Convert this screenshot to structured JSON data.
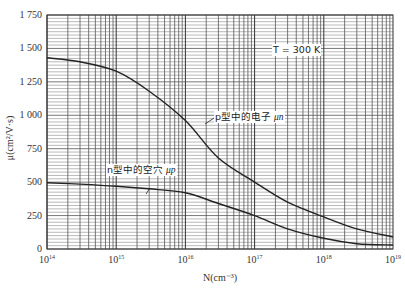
{
  "chart_data": {
    "type": "line",
    "title": "",
    "xlabel": "N(cm⁻³)",
    "ylabel": "μ(cm²/V·s)",
    "xscale": "log",
    "xlim": [
      100000000000000.0,
      1e+19
    ],
    "ylim": [
      0,
      1750
    ],
    "grid": true,
    "x_tick_labels": [
      {
        "base": "10",
        "exp": "14"
      },
      {
        "base": "10",
        "exp": "15"
      },
      {
        "base": "10",
        "exp": "16"
      },
      {
        "base": "10",
        "exp": "17"
      },
      {
        "base": "10",
        "exp": "18"
      },
      {
        "base": "10",
        "exp": "19"
      }
    ],
    "y_tick_labels": [
      "0",
      "250",
      "500",
      "750",
      "1 000",
      "1 250",
      "1 500",
      "1 750"
    ],
    "y_tick_values": [
      0,
      250,
      500,
      750,
      1000,
      1250,
      1500,
      1750
    ],
    "annotations": {
      "temperature": "T=300 K",
      "electron_label": "p型中的电子 μn",
      "hole_label": "n型中的空穴 μp"
    },
    "x": [
      100000000000000.0,
      300000000000000.0,
      1000000000000000.0,
      3000000000000000.0,
      1e+16,
      3e+16,
      1e+17,
      3e+17,
      1e+18,
      3e+18,
      1e+19
    ],
    "series": [
      {
        "name": "p型中的电子 μn",
        "values": [
          1430,
          1400,
          1330,
          1180,
          960,
          680,
          500,
          350,
          240,
          150,
          90
        ]
      },
      {
        "name": "n型中的空穴 μp",
        "values": [
          495,
          485,
          470,
          450,
          420,
          340,
          250,
          150,
          80,
          40,
          30
        ]
      }
    ]
  },
  "labels": {
    "temperature": "T = 300 K",
    "electron_prefix": "p型中的电子 ",
    "electron_symbol": "μn",
    "hole_prefix": "n型中的空穴 ",
    "hole_symbol": "μp",
    "xlabel": "N(cm⁻³)",
    "ylabel": "μ(cm²/V·s)"
  },
  "ticks": {
    "y": [
      "0",
      "250",
      "500",
      "750",
      "1 000",
      "1 250",
      "1 500",
      "1 750"
    ],
    "x_base": "10",
    "x_exp": [
      "14",
      "15",
      "16",
      "17",
      "18",
      "19"
    ]
  }
}
